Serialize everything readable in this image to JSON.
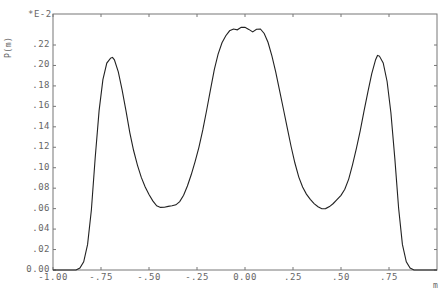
{
  "chart_data": {
    "type": "line",
    "title": "",
    "xlabel": "m",
    "ylabel": "P(m)",
    "y_multiplier": "*E-2",
    "xlim": [
      -1.0,
      1.0
    ],
    "ylim": [
      0.0,
      0.24
    ],
    "grid": false,
    "legend": null,
    "x_ticks": [
      "-1.00",
      "-.75",
      "-.50",
      "-.25",
      "0.00",
      ".25",
      ".50",
      ".75"
    ],
    "y_ticks": [
      "0.00",
      ".02",
      ".04",
      ".06",
      ".08",
      ".10",
      ".12",
      ".14",
      ".16",
      ".18",
      ".20",
      ".22"
    ],
    "series": [
      {
        "name": "P(m)",
        "x": [
          -1.0,
          -0.88,
          -0.86,
          -0.84,
          -0.82,
          -0.8,
          -0.78,
          -0.76,
          -0.74,
          -0.72,
          -0.7,
          -0.69,
          -0.68,
          -0.66,
          -0.64,
          -0.62,
          -0.6,
          -0.58,
          -0.56,
          -0.54,
          -0.52,
          -0.5,
          -0.48,
          -0.46,
          -0.44,
          -0.42,
          -0.4,
          -0.38,
          -0.36,
          -0.34,
          -0.32,
          -0.3,
          -0.28,
          -0.26,
          -0.24,
          -0.22,
          -0.2,
          -0.18,
          -0.16,
          -0.14,
          -0.12,
          -0.1,
          -0.08,
          -0.06,
          -0.04,
          -0.02,
          0.0,
          0.02,
          0.04,
          0.06,
          0.08,
          0.1,
          0.12,
          0.14,
          0.16,
          0.18,
          0.2,
          0.22,
          0.24,
          0.26,
          0.28,
          0.3,
          0.32,
          0.34,
          0.36,
          0.38,
          0.4,
          0.42,
          0.44,
          0.46,
          0.48,
          0.5,
          0.52,
          0.54,
          0.56,
          0.58,
          0.6,
          0.62,
          0.64,
          0.66,
          0.68,
          0.69,
          0.7,
          0.72,
          0.74,
          0.76,
          0.78,
          0.8,
          0.82,
          0.84,
          0.86,
          0.88,
          1.0
        ],
        "values": [
          0.0,
          0.0,
          0.002,
          0.008,
          0.025,
          0.06,
          0.11,
          0.155,
          0.185,
          0.202,
          0.208,
          0.209,
          0.206,
          0.193,
          0.175,
          0.155,
          0.135,
          0.118,
          0.103,
          0.09,
          0.08,
          0.073,
          0.068,
          0.064,
          0.062,
          0.061,
          0.061,
          0.062,
          0.064,
          0.068,
          0.074,
          0.082,
          0.092,
          0.105,
          0.12,
          0.138,
          0.157,
          0.176,
          0.195,
          0.21,
          0.222,
          0.23,
          0.235,
          0.236,
          0.234,
          0.236,
          0.237,
          0.236,
          0.234,
          0.236,
          0.235,
          0.23,
          0.222,
          0.21,
          0.195,
          0.176,
          0.157,
          0.138,
          0.12,
          0.105,
          0.092,
          0.082,
          0.074,
          0.068,
          0.064,
          0.062,
          0.061,
          0.061,
          0.062,
          0.064,
          0.068,
          0.073,
          0.08,
          0.09,
          0.103,
          0.118,
          0.135,
          0.155,
          0.175,
          0.193,
          0.206,
          0.209,
          0.208,
          0.202,
          0.185,
          0.155,
          0.11,
          0.06,
          0.025,
          0.008,
          0.002,
          0.0,
          0.0
        ]
      }
    ],
    "annotations": [
      "Three peaks at m≈-0.69, 0.00, +0.69",
      "Minima ≈0.061 at m≈±0.40"
    ]
  },
  "axes": {
    "ylabel": "P(m)",
    "multiplier": "*E-2",
    "xlabel": "m"
  }
}
